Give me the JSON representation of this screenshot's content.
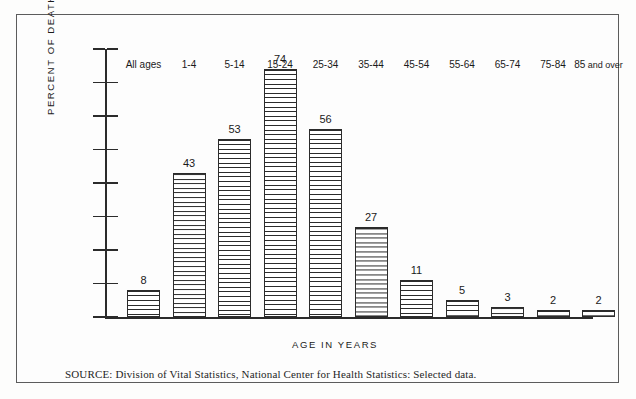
{
  "chart_data": {
    "type": "bar",
    "title": "",
    "xlabel": "AGE IN YEARS",
    "ylabel": "PERCENT OF DEATHS",
    "categories": [
      "All ages",
      "1-4",
      "5-14",
      "15-24",
      "25-34",
      "35-44",
      "45-54",
      "55-64",
      "65-74",
      "75-84",
      "85 and over"
    ],
    "values": [
      8,
      43,
      53,
      74,
      56,
      27,
      11,
      5,
      3,
      2,
      2
    ],
    "ylim": [
      0,
      80
    ],
    "yticks": [
      0,
      10,
      20,
      30,
      40,
      50,
      60,
      70,
      80
    ],
    "ytick_labels": [
      "0",
      "10",
      "20",
      "30",
      "40",
      "50",
      "60",
      "70",
      "80"
    ],
    "grid": false,
    "legend": null,
    "bar_style": "horizontal-hatch",
    "data_labels": [
      "8",
      "43",
      "53",
      "74",
      "56",
      "27",
      "11",
      "5",
      "3",
      "2",
      "2"
    ]
  },
  "axes": {
    "y_title": "PERCENT OF DEATHS",
    "x_title": "AGE IN YEARS"
  },
  "categories_display": [
    {
      "label": "All ages",
      "suffix": ""
    },
    {
      "label": "1-4",
      "suffix": ""
    },
    {
      "label": "5-14",
      "suffix": ""
    },
    {
      "label": "15-24",
      "suffix": ""
    },
    {
      "label": "25-34",
      "suffix": ""
    },
    {
      "label": "35-44",
      "suffix": ""
    },
    {
      "label": "45-54",
      "suffix": ""
    },
    {
      "label": "55-64",
      "suffix": ""
    },
    {
      "label": "65-74",
      "suffix": ""
    },
    {
      "label": "75-84",
      "suffix": ""
    },
    {
      "label": "85",
      "suffix": " and over"
    }
  ],
  "notes": {
    "source": "SOURCE: Division of Vital Statistics, National Center for Health Statistics: Selected data."
  },
  "colors": {
    "ink": "#2b2b2b",
    "frame": "#5c5c5c",
    "paper": "#fdfdfd"
  }
}
